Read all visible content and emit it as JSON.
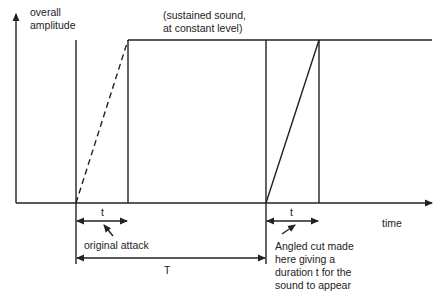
{
  "diagram": {
    "y_axis_label_line1": "overall",
    "y_axis_label_line2": "amplitude",
    "x_axis_label": "time",
    "sustain_label_line1": "(sustained sound,",
    "sustain_label_line2": "at constant level)",
    "short_duration_label_left": "t",
    "short_duration_label_right": "t",
    "long_duration_label": "T",
    "original_attack_label": "original attack",
    "cut_note_line1": "Angled cut made",
    "cut_note_line2": "here giving a",
    "cut_note_line3": "duration t for the",
    "cut_note_line4": "sound to appear",
    "stroke_color": "#222222"
  }
}
